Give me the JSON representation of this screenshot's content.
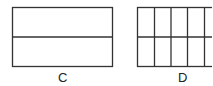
{
  "figures": [
    {
      "label": "C",
      "rows": 2,
      "cols": 1
    },
    {
      "label": "D",
      "rows": 2,
      "cols": 5
    }
  ]
}
